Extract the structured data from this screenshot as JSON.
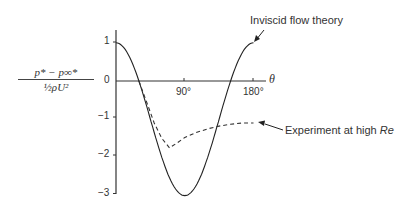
{
  "chart_data": {
    "type": "line",
    "title": "",
    "xlabel": "θ",
    "ylabel": "(p* − p∞*) / ½ρU²",
    "x_ticks": [
      "90°",
      "180°"
    ],
    "y_ticks": [
      "1",
      "0",
      "−1",
      "−2",
      "−3"
    ],
    "xlim": [
      0,
      200
    ],
    "ylim": [
      -3,
      1.2
    ],
    "grid": false,
    "series": [
      {
        "name": "Inviscid flow theory",
        "style": "solid",
        "formula": "1 - 4 sin^2(theta)",
        "x": [
          0,
          15,
          30,
          45,
          60,
          75,
          90,
          105,
          120,
          135,
          150,
          165,
          180
        ],
        "y": [
          1,
          0.73,
          0,
          -1,
          -2,
          -2.73,
          -3,
          -2.73,
          -2,
          -1,
          0,
          0.73,
          1
        ]
      },
      {
        "name": "Experiment at high Re",
        "style": "dashed",
        "x": [
          30,
          40,
          50,
          60,
          70,
          80,
          90,
          105,
          120,
          135,
          150,
          165,
          180
        ],
        "y": [
          0,
          -0.55,
          -1.1,
          -1.5,
          -1.75,
          -1.62,
          -1.48,
          -1.35,
          -1.25,
          -1.18,
          -1.13,
          -1.1,
          -1.1
        ]
      }
    ],
    "annotations": [
      {
        "text": "Inviscid flow theory",
        "points_to": [
          180,
          1
        ]
      },
      {
        "text": "Experiment at high Re",
        "points_to": [
          180,
          -1.1
        ]
      }
    ]
  },
  "labels": {
    "ylab_num": "p* − p∞*",
    "ylab_den": "½ρU²",
    "x_axis_symbol": "θ",
    "tick_90": "90°",
    "tick_180": "180°",
    "y1": "1",
    "y0": "0",
    "ym1": "−1",
    "ym2": "−2",
    "ym3": "−3",
    "theory": "Inviscid flow theory",
    "experiment_prefix": "Experiment at high ",
    "experiment_re": "Re"
  }
}
